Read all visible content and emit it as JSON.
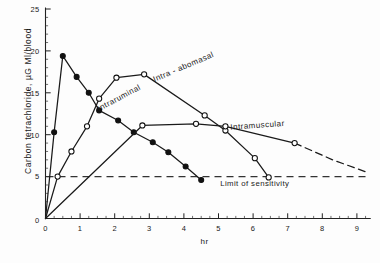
{
  "figure": {
    "ylabel": "Carbon tetrachloride,  µG  Ml/blood",
    "xlabel": "hr"
  },
  "chart_data": {
    "type": "line",
    "title": "",
    "xlabel": "hr",
    "ylabel": "Carbon tetrachloride, µG Ml/blood",
    "xlim": [
      0,
      9.4
    ],
    "ylim": [
      0,
      25
    ],
    "xticks": [
      0,
      1,
      2,
      3,
      4,
      5,
      6,
      7,
      8,
      9
    ],
    "xtick_labels": [
      "0",
      "1",
      "2",
      "3",
      "4",
      "5",
      "6",
      "7",
      "8",
      "9"
    ],
    "xminor_step": 0.25,
    "yticks": [
      0,
      5,
      10,
      15,
      20,
      25
    ],
    "ytick_labels": [
      "0",
      "5",
      "10",
      "15",
      "20",
      "25"
    ],
    "yminor_step": 1,
    "grid": false,
    "legend": "inline-curve-labels",
    "annotations": [
      {
        "text": "Limit of sensitivity",
        "x": 5.05,
        "y": 3.9
      },
      {
        "text": "Intra - abomasal",
        "x": 3.15,
        "y": 16.3,
        "rotation": -23
      },
      {
        "text": "Intraruminal",
        "x": 1.55,
        "y": 12.8,
        "rotation": -28
      },
      {
        "text": "Intramuscular",
        "x": 5.35,
        "y": 10.6,
        "rotation": -4
      }
    ],
    "threshold_line": {
      "label": "Limit of sensitivity",
      "value": 5,
      "style": "dashed"
    },
    "series": [
      {
        "name": "Intraruminal",
        "marker": "filled-circle",
        "style": "solid",
        "points": [
          {
            "x": 0.0,
            "y": 0.0
          },
          {
            "x": 0.25,
            "y": 10.3
          },
          {
            "x": 0.5,
            "y": 19.4
          },
          {
            "x": 0.9,
            "y": 16.9
          },
          {
            "x": 1.25,
            "y": 15.0
          },
          {
            "x": 1.55,
            "y": 12.9
          },
          {
            "x": 2.1,
            "y": 11.7
          },
          {
            "x": 2.55,
            "y": 10.3
          },
          {
            "x": 3.1,
            "y": 9.1
          },
          {
            "x": 3.55,
            "y": 7.9
          },
          {
            "x": 4.05,
            "y": 6.2
          },
          {
            "x": 4.5,
            "y": 4.6
          }
        ]
      },
      {
        "name": "Intra - abomasal",
        "marker": "open-circle",
        "style": "solid",
        "points": [
          {
            "x": 0.0,
            "y": 0.0
          },
          {
            "x": 0.35,
            "y": 5.0
          },
          {
            "x": 0.75,
            "y": 8.0
          },
          {
            "x": 1.2,
            "y": 11.0
          },
          {
            "x": 1.55,
            "y": 14.3
          },
          {
            "x": 2.05,
            "y": 16.8
          },
          {
            "x": 2.85,
            "y": 17.2
          },
          {
            "x": 4.6,
            "y": 12.3
          },
          {
            "x": 5.2,
            "y": 10.5
          },
          {
            "x": 6.05,
            "y": 7.2
          },
          {
            "x": 6.45,
            "y": 4.9
          }
        ]
      },
      {
        "name": "Intramuscular",
        "marker": "open-circle",
        "style": "solid-with-dashed-tail",
        "points": [
          {
            "x": 0.0,
            "y": 0.0
          },
          {
            "x": 2.8,
            "y": 11.1
          },
          {
            "x": 4.35,
            "y": 11.3
          },
          {
            "x": 5.2,
            "y": 11.0
          },
          {
            "x": 7.2,
            "y": 9.0
          }
        ],
        "dashed_tail": [
          {
            "x": 7.2,
            "y": 9.0
          },
          {
            "x": 8.3,
            "y": 7.0
          },
          {
            "x": 9.3,
            "y": 5.5
          }
        ]
      }
    ]
  }
}
